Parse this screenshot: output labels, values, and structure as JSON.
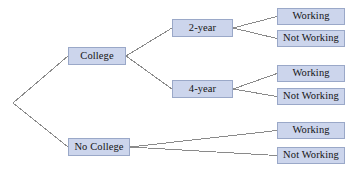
{
  "diagram": {
    "type": "probability-tree",
    "title": "",
    "canvas": {
      "width": 351,
      "height": 173,
      "background": "#ffffff"
    },
    "style": {
      "node_fill": "#ccd5ec",
      "node_border": "#9aa8c8",
      "edge_color": "#8a8a8a",
      "text_color": "#141414"
    },
    "root": {
      "x": 13,
      "y": 103
    },
    "nodes": [
      {
        "id": "college",
        "label": "College",
        "x": 68,
        "y": 47,
        "w": 58,
        "h": 18
      },
      {
        "id": "no-college",
        "label": "No College",
        "x": 68,
        "y": 138,
        "w": 62,
        "h": 18
      },
      {
        "id": "two-year",
        "label": "2-year",
        "x": 172,
        "y": 19,
        "w": 61,
        "h": 18
      },
      {
        "id": "four-year",
        "label": "4-year",
        "x": 172,
        "y": 80,
        "w": 61,
        "h": 18
      },
      {
        "id": "work-2yr",
        "label": "Working",
        "x": 277,
        "y": 8,
        "w": 68,
        "h": 17
      },
      {
        "id": "notwork-2yr",
        "label": "Not Working",
        "x": 277,
        "y": 30,
        "w": 68,
        "h": 17
      },
      {
        "id": "work-4yr",
        "label": "Working",
        "x": 277,
        "y": 65,
        "w": 68,
        "h": 17
      },
      {
        "id": "notwork-4yr",
        "label": "Not Working",
        "x": 277,
        "y": 88,
        "w": 68,
        "h": 17
      },
      {
        "id": "work-nocol",
        "label": "Working",
        "x": 277,
        "y": 122,
        "w": 68,
        "h": 17
      },
      {
        "id": "notwork-nocol",
        "label": "Not Working",
        "x": 277,
        "y": 147,
        "w": 68,
        "h": 17
      }
    ],
    "edges": [
      {
        "from": "root",
        "to": "college"
      },
      {
        "from": "root",
        "to": "no-college"
      },
      {
        "from": "college",
        "to": "two-year"
      },
      {
        "from": "college",
        "to": "four-year"
      },
      {
        "from": "two-year",
        "to": "work-2yr"
      },
      {
        "from": "two-year",
        "to": "notwork-2yr"
      },
      {
        "from": "four-year",
        "to": "work-4yr"
      },
      {
        "from": "four-year",
        "to": "notwork-4yr"
      },
      {
        "from": "no-college",
        "to": "work-nocol"
      },
      {
        "from": "no-college",
        "to": "notwork-nocol"
      }
    ]
  }
}
